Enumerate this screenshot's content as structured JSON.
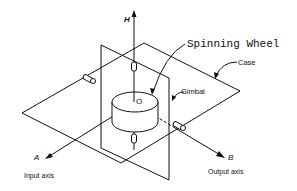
{
  "diagram": {
    "labels": {
      "spinning_wheel": "Spinning Wheel",
      "case": "Case",
      "gimbal": "Gimbal",
      "axis_h": "H",
      "axis_a": "A",
      "axis_b": "B",
      "center": "O",
      "input_axis": "Input axis",
      "output_axis": "Output axis"
    },
    "colors": {
      "line": "#111111",
      "background": "#ffffff"
    }
  }
}
